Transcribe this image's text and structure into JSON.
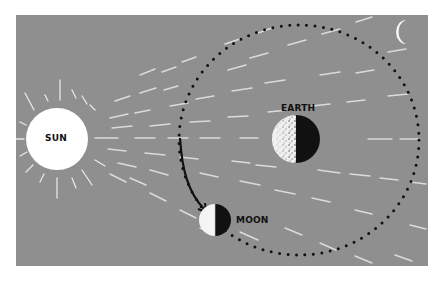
{
  "diagram": {
    "background_color": "#8f8f8f",
    "labels": {
      "sun": "SUN",
      "earth": "EARTH",
      "moon": "MOON"
    },
    "bodies": [
      {
        "name": "Sun",
        "cx": 57,
        "cy": 139,
        "r": 31,
        "color": "#ffffff"
      },
      {
        "name": "Earth",
        "cx": 296,
        "cy": 139,
        "r": 24,
        "lit_side": "left"
      },
      {
        "name": "Moon",
        "cx": 215,
        "cy": 220,
        "r": 16,
        "lit_side": "left"
      },
      {
        "name": "Crescent Moon",
        "cx": 408,
        "cy": 32
      }
    ],
    "orbit": {
      "cx": 299,
      "cy": 140,
      "rx": 120,
      "ry": 115,
      "style": "dotted"
    },
    "arrow": {
      "from": "orbit-left",
      "to": "moon",
      "color": "#111111"
    },
    "colors": {
      "panel": "#8f8f8f",
      "sun": "#ffffff",
      "shadow": "#111111",
      "rays": "#e6e6e6",
      "text": "#111111"
    }
  }
}
